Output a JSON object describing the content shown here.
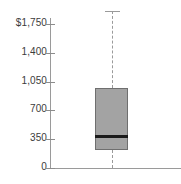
{
  "chart_data": {
    "type": "box",
    "title": "",
    "xlabel": "",
    "ylabel": "",
    "ylim": [
      0,
      1750
    ],
    "grid": false,
    "legend": null,
    "y_ticks": [
      {
        "value": 0,
        "label": "0"
      },
      {
        "value": 350,
        "label": "350"
      },
      {
        "value": 700,
        "label": "700"
      },
      {
        "value": 1050,
        "label": "1,050"
      },
      {
        "value": 1400,
        "label": "1,400"
      },
      {
        "value": 1750,
        "label": "$1,750"
      }
    ],
    "categories": [
      ""
    ],
    "series": [
      {
        "name": "",
        "boxes": [
          {
            "category": "",
            "min": 0,
            "q1": 220,
            "median": 390,
            "q3": 970,
            "max": 1910
          }
        ]
      }
    ],
    "style": {
      "box_fill": "#a3a3a3",
      "box_border": "#6f6f6f",
      "median_color": "#1a1a1a",
      "whisker_color": "#9a9a9a",
      "axis_color": "#9a9a9a",
      "tick_label_color": "#3c3c3c"
    }
  }
}
